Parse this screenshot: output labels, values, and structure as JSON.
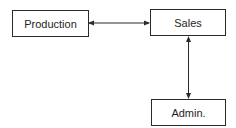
{
  "diagram": {
    "nodes": [
      {
        "id": "production",
        "label": "Production"
      },
      {
        "id": "sales",
        "label": "Sales"
      },
      {
        "id": "admin",
        "label": "Admin."
      }
    ],
    "edges": [
      {
        "from": "production",
        "to": "sales",
        "type": "bidirectional"
      },
      {
        "from": "sales",
        "to": "admin",
        "type": "bidirectional"
      }
    ],
    "colors": {
      "line": "#2a2a2a",
      "background": "#ffffff"
    }
  }
}
